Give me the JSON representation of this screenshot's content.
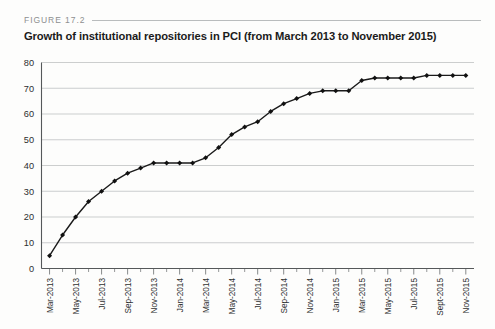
{
  "figure": {
    "number_label": "FIGURE 17.2",
    "title": "Growth of institutional repositories in PCI (from March 2013 to November 2015)"
  },
  "colors": {
    "line": "#1a1a1a",
    "marker": "#111111",
    "grid": "#b6b9ba",
    "axis": "#55585a",
    "figure_number_text": "#8d8f90",
    "title_text": "#1b1b1b",
    "background": "#fdfdfc"
  },
  "chart_data": {
    "type": "line",
    "title": "Growth of institutional repositories in PCI (from March 2013 to November 2015)",
    "xlabel": "",
    "ylabel": "",
    "ylim": [
      0,
      80
    ],
    "ytick_values": [
      0,
      10,
      20,
      30,
      40,
      50,
      60,
      70,
      80
    ],
    "ytick_labels": [
      "0",
      "10",
      "20",
      "30",
      "40",
      "50",
      "60",
      "70",
      "80"
    ],
    "grid": "horizontal",
    "legend": "none",
    "marker": "diamond",
    "x": [
      "Mar-2013",
      "Apr-2013",
      "May-2013",
      "Jun-2013",
      "Jul-2013",
      "Aug-2013",
      "Sep-2013",
      "Oct-2013",
      "Nov-2013",
      "Dec-2013",
      "Jan-2014",
      "Feb-2014",
      "Mar-2014",
      "Apr-2014",
      "May-2014",
      "Jun-2014",
      "Jul-2014",
      "Aug-2014",
      "Sep-2014",
      "Oct-2014",
      "Nov-2014",
      "Dec-2014",
      "Jan-2015",
      "Feb-2015",
      "Mar-2015",
      "Apr-2015",
      "May-2015",
      "Jun-2015",
      "Jul-2015",
      "Aug-2015",
      "Sept-2015",
      "Oct-2015",
      "Nov-2015"
    ],
    "xtick_labels_shown": [
      "Mar-2013",
      "May-2013",
      "Jul-2013",
      "Sep-2013",
      "Nov-2013",
      "Jan-2014",
      "Mar-2014",
      "May-2014",
      "Jul-2014",
      "Sep-2014",
      "Nov-2014",
      "Jan-2015",
      "Mar-2015",
      "May-2015",
      "Jul-2015",
      "Sept-2015",
      "Nov-2015"
    ],
    "values": [
      5,
      13,
      20,
      26,
      30,
      34,
      37,
      39,
      41,
      41,
      41,
      41,
      43,
      47,
      52,
      55,
      57,
      61,
      64,
      66,
      68,
      69,
      69,
      69,
      73,
      74,
      74,
      74,
      74,
      75,
      75,
      75,
      75
    ],
    "series": [
      {
        "name": "Institutional repositories in PCI",
        "values": [
          5,
          13,
          20,
          26,
          30,
          34,
          37,
          39,
          41,
          41,
          41,
          41,
          43,
          47,
          52,
          55,
          57,
          61,
          64,
          66,
          68,
          69,
          69,
          69,
          73,
          74,
          74,
          74,
          74,
          75,
          75,
          75,
          75
        ]
      }
    ]
  }
}
